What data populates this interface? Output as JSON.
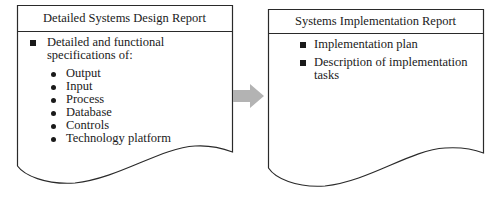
{
  "left_doc": {
    "title": "Detailed Systems Design Report",
    "items": [
      {
        "line1": "Detailed and functional",
        "line2": "specifications of:",
        "subitems": [
          "Output",
          "Input",
          "Process",
          "Database",
          "Controls",
          "Technology platform"
        ]
      }
    ]
  },
  "right_doc": {
    "title": "Systems Implementation Report",
    "items": [
      {
        "line1": "Implementation plan"
      },
      {
        "line1": "Description of implementation",
        "line2": "tasks"
      }
    ]
  },
  "arrow": {
    "color": "#b3b3b3",
    "direction": "right"
  },
  "colors": {
    "stroke": "#2a2a2a",
    "text": "#1a1a1a",
    "arrow": "#b3b3b3"
  }
}
